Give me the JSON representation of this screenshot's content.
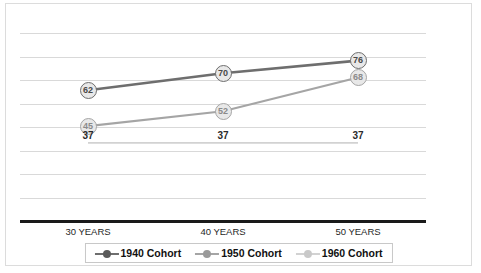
{
  "chart_data": {
    "type": "line",
    "title": "",
    "xlabel": "",
    "ylabel": "",
    "categories": [
      "30 YEARS",
      "40 YEARS",
      "50 YEARS"
    ],
    "ylim": [
      0,
      100
    ],
    "grid": true,
    "gridline_count": 8,
    "legend_position": "bottom",
    "series": [
      {
        "name": "1940 Cohort",
        "color": "#6e6e6e",
        "values": [
          62,
          70,
          76
        ],
        "labels": [
          "62",
          "70",
          "76"
        ]
      },
      {
        "name": "1950 Cohort",
        "color": "#a5a5a5",
        "values": [
          45,
          52,
          68
        ],
        "labels": [
          "45",
          "52",
          "68"
        ]
      },
      {
        "name": "1960 Cohort",
        "color": "#d2d2d2",
        "values": [
          37,
          37,
          37
        ],
        "labels": [
          "37",
          "37",
          "37"
        ]
      }
    ]
  },
  "axis": {
    "tick_labels": [
      "30 YEARS",
      "40 YEARS",
      "50 YEARS"
    ],
    "baseline_color": "#1a1a1a"
  },
  "legend": {
    "items": [
      {
        "label": "1940 Cohort",
        "marker": "circle-marker-dark"
      },
      {
        "label": "1950 Cohort",
        "marker": "circle-marker-medium"
      },
      {
        "label": "1960 Cohort",
        "marker": "circle-marker-light"
      }
    ]
  },
  "frame": {
    "border_color": "#dcdcdc",
    "gridline_color": "#d9d9d9",
    "background": "#ffffff"
  }
}
